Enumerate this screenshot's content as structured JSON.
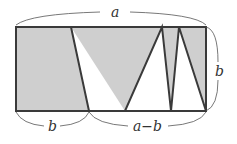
{
  "diagram": {
    "colors": {
      "shade": "#cfcfcf",
      "stroke": "#3a3a3a",
      "brace": "#555555",
      "background": "#ffffff"
    },
    "rectangle": {
      "x": 16,
      "y": 27,
      "width": 190,
      "height": 84
    },
    "zigzag_points": [
      [
        71,
        27
      ],
      [
        89,
        111
      ],
      [
        125,
        111
      ],
      [
        162,
        27
      ],
      [
        171,
        111
      ],
      [
        179,
        27
      ],
      [
        206,
        111
      ]
    ],
    "labels": {
      "top": "a",
      "right": "b",
      "bottom_left": "b",
      "bottom_right": "a−b"
    }
  }
}
